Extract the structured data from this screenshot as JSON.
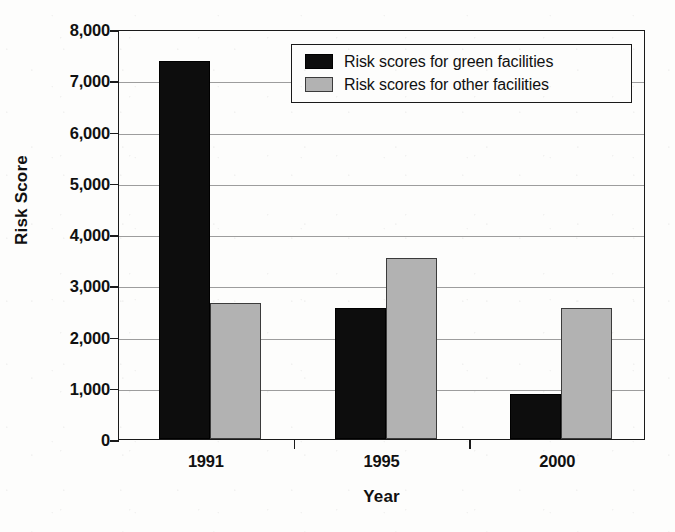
{
  "chart_data": {
    "type": "bar",
    "title": "",
    "xlabel": "Year",
    "ylabel": "Risk Score",
    "categories": [
      "1991",
      "1995",
      "2000"
    ],
    "series": [
      {
        "name": "Risk scores for green facilities",
        "color": "#0d0d0d",
        "values": [
          7370,
          2560,
          880
        ]
      },
      {
        "name": "Risk scores for other facilities",
        "color": "#b2b2b2",
        "values": [
          2650,
          3530,
          2560
        ]
      }
    ],
    "ylim": [
      0,
      8000
    ],
    "ytick_values": [
      0,
      1000,
      2000,
      3000,
      4000,
      5000,
      6000,
      7000,
      8000
    ],
    "ytick_labels": [
      "0",
      "1,000",
      "2,000",
      "3,000",
      "4,000",
      "5,000",
      "6,000",
      "7,000",
      "8,000"
    ],
    "grid": true,
    "legend_position": "top-right"
  },
  "legend": {
    "entries": [
      {
        "label": "Risk scores for green facilities",
        "swatch": "green-series"
      },
      {
        "label": "Risk scores for other facilities",
        "swatch": "other-series"
      }
    ]
  }
}
